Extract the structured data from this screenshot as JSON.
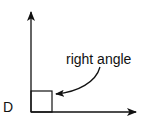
{
  "diagram": {
    "vertex_label": "D",
    "annotation": "right angle",
    "colors": {
      "stroke": "#111111",
      "background": "#ffffff"
    }
  }
}
